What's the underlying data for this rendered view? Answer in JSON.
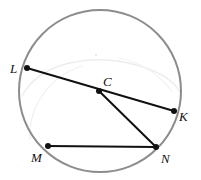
{
  "figure": {
    "type": "geometry-circle-diagram",
    "canvas": {
      "width": 201,
      "height": 180
    },
    "background_color": "#ffffff",
    "circle": {
      "name": "circle-C",
      "center": {
        "x": 100,
        "y": 91
      },
      "radius": 81,
      "stroke_color": "#8c8c8c",
      "stroke_width": 2,
      "fill": "none"
    },
    "points": [
      {
        "id": "L",
        "label": "L",
        "x": 27,
        "y": 68,
        "label_x": 10,
        "label_y": 73,
        "dot_color": "#111111",
        "dot_radius": 3
      },
      {
        "id": "C",
        "label": "C",
        "x": 99,
        "y": 91,
        "label_x": 103,
        "label_y": 86,
        "dot_color": "#111111",
        "dot_radius": 3
      },
      {
        "id": "K",
        "label": "K",
        "x": 174,
        "y": 111,
        "label_x": 179,
        "label_y": 121,
        "dot_color": "#111111",
        "dot_radius": 3
      },
      {
        "id": "M",
        "label": "M",
        "x": 48,
        "y": 146,
        "label_x": 31,
        "label_y": 162,
        "dot_color": "#111111",
        "dot_radius": 3
      },
      {
        "id": "N",
        "label": "N",
        "x": 156,
        "y": 147,
        "label_x": 161,
        "label_y": 163,
        "dot_color": "#111111",
        "dot_radius": 3
      }
    ],
    "segments": [
      {
        "id": "LK",
        "name": "diameter-L-K",
        "from": "L",
        "to": "K",
        "x1": 27,
        "y1": 68,
        "x2": 174,
        "y2": 111,
        "stroke_color": "#111111",
        "stroke_width": 2
      },
      {
        "id": "CN",
        "name": "radius-C-N",
        "from": "C",
        "to": "N",
        "x1": 99,
        "y1": 91,
        "x2": 156,
        "y2": 147,
        "stroke_color": "#111111",
        "stroke_width": 2
      },
      {
        "id": "MN",
        "name": "chord-M-N",
        "from": "M",
        "to": "N",
        "x1": 48,
        "y1": 146,
        "x2": 156,
        "y2": 147,
        "stroke_color": "#111111",
        "stroke_width": 2
      }
    ],
    "artifacts": [
      {
        "id": "scan-smudge-1",
        "d": "M 22 96 C 40 62 92 52 140 66 C 166 74 178 86 182 96",
        "stroke_color": "#ededed",
        "stroke_width": 1.4
      },
      {
        "id": "scan-smudge-2",
        "d": "M 30 140 C 28 110 46 78 82 66",
        "stroke_color": "#f0f0f0",
        "stroke_width": 1.2
      },
      {
        "id": "scan-smudge-3",
        "d": "M 118 58 C 140 62 160 74 172 92",
        "stroke_color": "#f2f2f2",
        "stroke_width": 1.2
      },
      {
        "id": "scan-speck-1",
        "cx": 96,
        "cy": 55,
        "r": 1.1,
        "fill": "#e6e6e6"
      },
      {
        "id": "scan-speck-2",
        "cx": 131,
        "cy": 64,
        "r": 0.9,
        "fill": "#ececec"
      }
    ]
  }
}
